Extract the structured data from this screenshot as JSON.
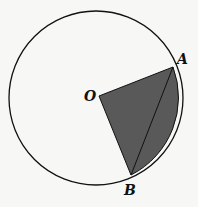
{
  "diagram": {
    "type": "circle-sector-with-chord",
    "labels": {
      "center": "O",
      "point_a": "A",
      "point_b": "B"
    },
    "colors": {
      "shade": "#595959",
      "stroke": "#111111",
      "background": "#f7f7f5"
    }
  }
}
